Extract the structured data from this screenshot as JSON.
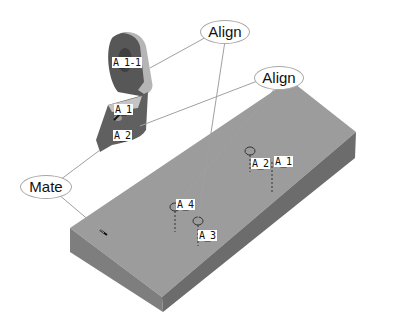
{
  "diagram": {
    "type": "cad-assembly-constraints",
    "colors": {
      "background": "#ffffff",
      "plate_top": "#9a9a9a",
      "plate_front": "#7c7c7c",
      "plate_side": "#6a6a6a",
      "bracket_dark": "#555555",
      "bracket_light": "#b8b8b8",
      "leader_line": "#a0a0a0"
    },
    "callouts": [
      {
        "id": "align-1",
        "label": "Align"
      },
      {
        "id": "align-2",
        "label": "Align"
      },
      {
        "id": "mate",
        "label": "Mate"
      }
    ],
    "bracket_tags": [
      {
        "label": "A_1-1"
      },
      {
        "label": "A_1"
      },
      {
        "label": "A_2"
      }
    ],
    "plate_tags": [
      {
        "label": "A_2"
      },
      {
        "label": "A_1"
      },
      {
        "label": "A_4"
      },
      {
        "label": "A_3"
      }
    ]
  }
}
